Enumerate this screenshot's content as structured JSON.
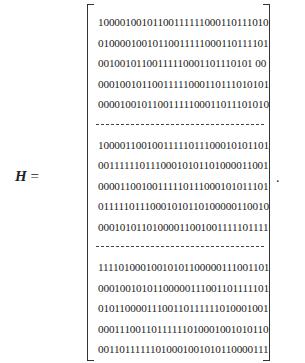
{
  "equation": {
    "lhs": "H",
    "equals": "=",
    "trailing_punctuation": ".",
    "blocks": [
      {
        "rows": [
          "10000100101100111111000110111010",
          "01000010010110011111000110111101",
          "00100101100111110001101110101 00",
          "00010010110011111000110111010101",
          "00001001011001111100011011101010"
        ]
      },
      {
        "rows": [
          "10000110010011111011100010101101",
          "00111111011100010101101000011001",
          "00001100100111110111000101011101",
          "01111101110001010110100000110010",
          "00010101101000011001001111101111"
        ]
      },
      {
        "rows": [
          "11110100010010101100000111001101",
          "00010010101100000111001101111101",
          "01011000011100110111111010001001",
          "00011100110111111010001001010110",
          "00110111111010001001010110000111"
        ]
      }
    ]
  }
}
